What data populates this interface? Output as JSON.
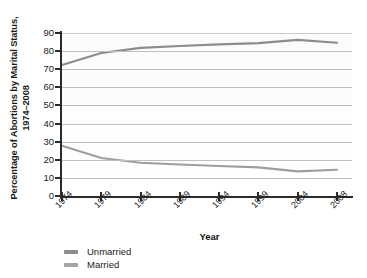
{
  "chart_data": {
    "type": "line",
    "title": "",
    "xlabel": "Year",
    "ylabel": "Percentage of Abortions by Marital Status, 1974–2008",
    "ylabel_line1": "Percentage of Abortions by Marital Status,",
    "ylabel_line2": "1974–2008",
    "categories": [
      "1974",
      "1979",
      "1984",
      "1989",
      "1994",
      "1999",
      "2004",
      "2008"
    ],
    "x": [
      1974,
      1979,
      1984,
      1989,
      1994,
      1999,
      2004,
      2008
    ],
    "series": [
      {
        "name": "Unmarried",
        "color": "#8c8c8c",
        "values": [
          72.3,
          79.0,
          81.8,
          82.8,
          83.7,
          84.4,
          86.2,
          84.6
        ]
      },
      {
        "name": "Married",
        "color": "#9e9e9e",
        "values": [
          27.7,
          21.0,
          18.4,
          17.4,
          16.6,
          15.8,
          13.6,
          14.5
        ]
      }
    ],
    "ylim": [
      0,
      90
    ],
    "yticks": [
      0,
      10,
      20,
      30,
      40,
      50,
      60,
      70,
      80,
      90
    ],
    "ytick_labels": [
      "0",
      "10",
      "20",
      "30",
      "40",
      "50",
      "60",
      "70",
      "80",
      "90"
    ],
    "grid": true,
    "grid_axis": "y",
    "legend_position": "below-left",
    "legend": [
      "Unmarried",
      "Married"
    ]
  },
  "legend": {
    "items": [
      {
        "label": "Unmarried",
        "color": "#8c8c8c"
      },
      {
        "label": "Married",
        "color": "#a3a3a3"
      }
    ]
  },
  "axis": {
    "x_title": "Year",
    "y_title_line1": "Percentage of Abortions by Marital Status,",
    "y_title_line2": "1974–2008"
  },
  "colors": {
    "axis": "#2b2b2b",
    "grid": "#bfbfbf",
    "unmarried": "#8c8c8c",
    "married": "#a3a3a3",
    "text": "#1a1a1a",
    "plot_background": "#fcfcfc"
  }
}
